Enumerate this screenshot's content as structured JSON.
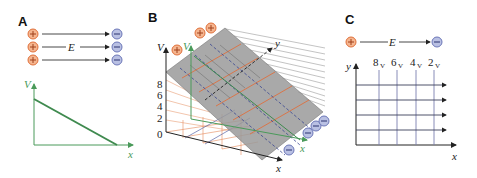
{
  "figure": {
    "panels": [
      {
        "id": "A",
        "label": "A",
        "field_label": "E",
        "charges": {
          "positive_symbol": "+",
          "negative_symbol": "−",
          "count_per_side": 3
        },
        "graph": {
          "y_axis_label": "V",
          "x_axis_label": "x",
          "line": "linear decreasing"
        }
      },
      {
        "id": "B",
        "label": "B",
        "v_axis_label": "V",
        "v_ticks": [
          "0",
          "2",
          "4",
          "6",
          "8"
        ],
        "inner_v_axis_label": "V",
        "y_axis_label": "y",
        "x_axis_label": "x",
        "inner_x_axis_label": "x",
        "charges": {
          "positive_count": 3,
          "negative_count": 4,
          "positive_symbol": "+",
          "negative_symbol": "−"
        }
      },
      {
        "id": "C",
        "label": "C",
        "field_label": "E",
        "y_axis_label": "y",
        "x_axis_label": "x",
        "equipotentials": [
          {
            "value": "8",
            "unit": "V"
          },
          {
            "value": "6",
            "unit": "V"
          },
          {
            "value": "4",
            "unit": "V"
          },
          {
            "value": "2",
            "unit": "V"
          }
        ],
        "field_lines": 4,
        "charges": {
          "positive_symbol": "+",
          "negative_symbol": "−"
        }
      }
    ],
    "colors": {
      "positive_fill": "#f5b58f",
      "positive_stroke": "#e0703a",
      "negative_fill": "#b9c0e3",
      "negative_stroke": "#6c77b8",
      "green": "#4a9a5a",
      "orange_grid": "#e58a5a",
      "blue_dash": "#5a66a8",
      "plane": "#9a9a9a",
      "axis": "#222222"
    }
  }
}
